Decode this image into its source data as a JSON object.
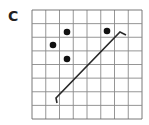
{
  "panel": {
    "label": "C"
  },
  "grid": {
    "cols": 8,
    "rows": 8,
    "x0": 32,
    "y0": 10,
    "x1": 142,
    "y1": 119,
    "line_color": "#8a8a8a",
    "border_color": "#6a6a6a"
  },
  "dots": [
    {
      "cx": 67,
      "cy": 32
    },
    {
      "cx": 107,
      "cy": 31
    },
    {
      "cx": 53,
      "cy": 45
    },
    {
      "cx": 67,
      "cy": 59
    }
  ],
  "segment": {
    "x1": 56,
    "y1": 98,
    "x2": 120,
    "y2": 32,
    "hook_start": {
      "x": 57,
      "y": 103
    },
    "hook_end": {
      "x": 126,
      "y": 35
    },
    "color": "#2a2a2a"
  },
  "colors": {
    "dot": "#111111"
  }
}
